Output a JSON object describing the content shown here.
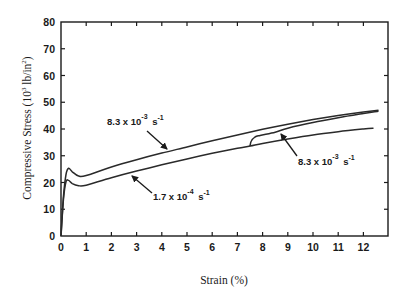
{
  "chart_data": {
    "type": "line",
    "title": "",
    "xlabel": "Strain (%)",
    "ylabel": "Compressive Stress (10^3 lb/in^2)",
    "xlim": [
      0,
      12.9
    ],
    "ylim": [
      0,
      80
    ],
    "x_ticks": [
      0,
      1,
      2,
      3,
      4,
      5,
      6,
      7,
      8,
      9,
      10,
      11,
      12
    ],
    "y_ticks": [
      0,
      10,
      20,
      30,
      40,
      50,
      60,
      70,
      80
    ],
    "grid": false,
    "legend": "none (inline annotations with arrows)",
    "series": [
      {
        "name": "8.3 x 10^-3 s^-1",
        "x": [
          0,
          0.1,
          0.2,
          0.3,
          0.45,
          0.7,
          1,
          2,
          3,
          4,
          5,
          6,
          7,
          8,
          9,
          10,
          11,
          12,
          12.6
        ],
        "y": [
          0,
          15,
          23,
          25.3,
          24,
          22.4,
          22.6,
          25.8,
          28.5,
          31,
          33.3,
          35.6,
          37.8,
          39.9,
          41.8,
          43.5,
          45,
          46.3,
          47
        ]
      },
      {
        "name": "1.7 x 10^-4 s^-1",
        "x": [
          0,
          0.1,
          0.2,
          0.3,
          0.45,
          0.7,
          1,
          2,
          3,
          4,
          5,
          6,
          7,
          7.5,
          8,
          9,
          10,
          11,
          12,
          12.4
        ],
        "y": [
          0,
          14,
          20.3,
          20.8,
          19.6,
          18.8,
          19,
          21.8,
          24.3,
          26.6,
          28.8,
          30.9,
          32.8,
          33.6,
          34.6,
          36.3,
          37.8,
          39,
          40,
          40.3
        ]
      },
      {
        "name": "8.3 x 10^-3 s^-1 (rate jump at 7.5% strain)",
        "x": [
          7.5,
          7.55,
          7.7,
          7.9,
          8.5,
          9,
          10,
          11,
          12,
          12.6
        ],
        "y": [
          33.6,
          35.5,
          37,
          37.6,
          38.8,
          40.3,
          42.4,
          44.2,
          45.8,
          46.6
        ]
      }
    ],
    "annotations": [
      {
        "text_base": "8.3 x 10",
        "exp": "-3",
        "unit": "s",
        "unit_exp": "-1",
        "points_to": "upper curve"
      },
      {
        "text_base": "1.7 x 10",
        "exp": "-4",
        "unit": "s",
        "unit_exp": "-1",
        "points_to": "lower curve"
      },
      {
        "text_base": "8.3 x 10",
        "exp": "-3",
        "unit": "s",
        "unit_exp": "-1",
        "points_to": "rate-jump curve"
      }
    ]
  },
  "labels": {
    "x_axis": "Strain (%)",
    "y_axis_main": "Compressive Stress (10",
    "y_axis_exp": "3",
    "y_axis_unit": " lb/in",
    "y_axis_unit_exp": "2",
    "y_axis_close": ")",
    "x_tick_labels": [
      "0",
      "1",
      "2",
      "3",
      "4",
      "5",
      "6",
      "7",
      "8",
      "9",
      "10",
      "11",
      "12"
    ],
    "y_tick_labels": [
      "0",
      "10",
      "20",
      "30",
      "40",
      "50",
      "60",
      "70",
      "80"
    ],
    "anno1_base": "8.3 x 10",
    "anno1_exp": "-3",
    "anno1_unit": " s",
    "anno1_unit_exp": "-1",
    "anno2_base": "1.7 x 10",
    "anno2_exp": "-4",
    "anno2_unit": " s",
    "anno2_unit_exp": "-1",
    "anno3_base": "8.3 x 10",
    "anno3_exp": "-3",
    "anno3_unit": " s",
    "anno3_unit_exp": "-1"
  },
  "style": {
    "line_color": "#2a2a2a",
    "axis_color": "#1a1a1a",
    "background": "#ffffff"
  }
}
